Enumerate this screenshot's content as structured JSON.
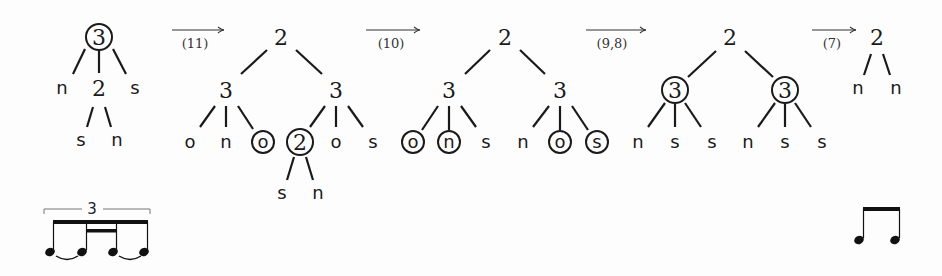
{
  "diagram": {
    "type": "rhythm-tree-rewriting",
    "trees": [
      {
        "id": "tree-1",
        "nodes": [
          {
            "label": "3",
            "x": 99,
            "y": 37,
            "kind": "num",
            "circled": true
          },
          {
            "label": "n",
            "x": 62,
            "y": 88,
            "kind": "leaf",
            "circled": false
          },
          {
            "label": "2",
            "x": 99,
            "y": 88,
            "kind": "num",
            "circled": false
          },
          {
            "label": "s",
            "x": 135,
            "y": 88,
            "kind": "leaf",
            "circled": false
          },
          {
            "label": "s",
            "x": 81,
            "y": 140,
            "kind": "leaf",
            "circled": false
          },
          {
            "label": "n",
            "x": 117,
            "y": 140,
            "kind": "leaf",
            "circled": false
          }
        ],
        "edges": [
          [
            85,
            49,
            73,
            74
          ],
          [
            99,
            50,
            99,
            73
          ],
          [
            113,
            49,
            126,
            74
          ],
          [
            93,
            107,
            87,
            127
          ],
          [
            105,
            107,
            111,
            127
          ]
        ]
      },
      {
        "id": "tree-2",
        "nodes": [
          {
            "label": "2",
            "x": 281,
            "y": 37,
            "kind": "num",
            "circled": false
          },
          {
            "label": "3",
            "x": 226,
            "y": 90,
            "kind": "num",
            "circled": false
          },
          {
            "label": "3",
            "x": 336,
            "y": 90,
            "kind": "num",
            "circled": false
          },
          {
            "label": "o",
            "x": 190,
            "y": 142,
            "kind": "leaf",
            "circled": false
          },
          {
            "label": "n",
            "x": 226,
            "y": 142,
            "kind": "leaf",
            "circled": false
          },
          {
            "label": "o",
            "x": 263,
            "y": 142,
            "kind": "leaf",
            "circled": true
          },
          {
            "label": "2",
            "x": 300,
            "y": 142,
            "kind": "num",
            "circled": true
          },
          {
            "label": "o",
            "x": 336,
            "y": 142,
            "kind": "leaf",
            "circled": false
          },
          {
            "label": "s",
            "x": 373,
            "y": 142,
            "kind": "leaf",
            "circled": false
          },
          {
            "label": "s",
            "x": 282,
            "y": 193,
            "kind": "leaf",
            "circled": false
          },
          {
            "label": "n",
            "x": 318,
            "y": 193,
            "kind": "leaf",
            "circled": false
          }
        ],
        "edges": [
          [
            267,
            50,
            241,
            74
          ],
          [
            296,
            50,
            322,
            74
          ],
          [
            215,
            106,
            200,
            127
          ],
          [
            226,
            106,
            226,
            127
          ],
          [
            238,
            106,
            253,
            129
          ],
          [
            325,
            106,
            310,
            127
          ],
          [
            336,
            106,
            336,
            127
          ],
          [
            348,
            106,
            363,
            127
          ],
          [
            294,
            157,
            287,
            180
          ],
          [
            306,
            157,
            313,
            180
          ]
        ]
      },
      {
        "id": "tree-3",
        "nodes": [
          {
            "label": "2",
            "x": 505,
            "y": 37,
            "kind": "num",
            "circled": false
          },
          {
            "label": "3",
            "x": 449,
            "y": 90,
            "kind": "num",
            "circled": false
          },
          {
            "label": "3",
            "x": 560,
            "y": 90,
            "kind": "num",
            "circled": false
          },
          {
            "label": "o",
            "x": 413,
            "y": 142,
            "kind": "leaf",
            "circled": true
          },
          {
            "label": "n",
            "x": 449,
            "y": 142,
            "kind": "leaf",
            "circled": true
          },
          {
            "label": "s",
            "x": 486,
            "y": 142,
            "kind": "leaf",
            "circled": false
          },
          {
            "label": "n",
            "x": 523,
            "y": 142,
            "kind": "leaf",
            "circled": false
          },
          {
            "label": "o",
            "x": 560,
            "y": 142,
            "kind": "leaf",
            "circled": true
          },
          {
            "label": "s",
            "x": 597,
            "y": 142,
            "kind": "leaf",
            "circled": true
          }
        ],
        "edges": [
          [
            490,
            50,
            465,
            74
          ],
          [
            520,
            50,
            545,
            74
          ],
          [
            438,
            106,
            422,
            130
          ],
          [
            449,
            106,
            449,
            130
          ],
          [
            461,
            106,
            476,
            127
          ],
          [
            549,
            106,
            533,
            127
          ],
          [
            560,
            106,
            560,
            130
          ],
          [
            572,
            106,
            588,
            130
          ]
        ]
      },
      {
        "id": "tree-4",
        "nodes": [
          {
            "label": "2",
            "x": 730,
            "y": 37,
            "kind": "num",
            "circled": false
          },
          {
            "label": "3",
            "x": 675,
            "y": 90,
            "kind": "num",
            "circled": true
          },
          {
            "label": "3",
            "x": 785,
            "y": 90,
            "kind": "num",
            "circled": true
          },
          {
            "label": "n",
            "x": 638,
            "y": 142,
            "kind": "leaf",
            "circled": false
          },
          {
            "label": "s",
            "x": 675,
            "y": 142,
            "kind": "leaf",
            "circled": false
          },
          {
            "label": "s",
            "x": 712,
            "y": 142,
            "kind": "leaf",
            "circled": false
          },
          {
            "label": "n",
            "x": 748,
            "y": 142,
            "kind": "leaf",
            "circled": false
          },
          {
            "label": "s",
            "x": 785,
            "y": 142,
            "kind": "leaf",
            "circled": false
          },
          {
            "label": "s",
            "x": 822,
            "y": 142,
            "kind": "leaf",
            "circled": false
          }
        ],
        "edges": [
          [
            716,
            51,
            688,
            77
          ],
          [
            745,
            51,
            773,
            77
          ],
          [
            665,
            103,
            648,
            127
          ],
          [
            675,
            104,
            675,
            127
          ],
          [
            685,
            103,
            701,
            127
          ],
          [
            775,
            103,
            758,
            127
          ],
          [
            785,
            104,
            785,
            127
          ],
          [
            795,
            103,
            811,
            127
          ]
        ]
      },
      {
        "id": "tree-5",
        "nodes": [
          {
            "label": "2",
            "x": 877,
            "y": 37,
            "kind": "num",
            "circled": false
          },
          {
            "label": "n",
            "x": 858,
            "y": 88,
            "kind": "leaf",
            "circled": false
          },
          {
            "label": "n",
            "x": 896,
            "y": 88,
            "kind": "leaf",
            "circled": false
          }
        ],
        "edges": [
          [
            871,
            54,
            864,
            75
          ],
          [
            883,
            54,
            890,
            75
          ]
        ]
      }
    ],
    "arrows": [
      {
        "label": "(11)",
        "x1": 172,
        "x2": 224,
        "y": 30,
        "label_x": 195,
        "label_y": 48
      },
      {
        "label": "(10)",
        "x1": 366,
        "x2": 420,
        "y": 30,
        "label_x": 391,
        "label_y": 48
      },
      {
        "label": "(9,8)",
        "x1": 586,
        "x2": 646,
        "y": 30,
        "label_x": 612,
        "label_y": 48
      },
      {
        "label": "(7)",
        "x1": 812,
        "x2": 856,
        "y": 30,
        "label_x": 832,
        "label_y": 48
      }
    ],
    "notation": {
      "left": {
        "tuplet_label": "3",
        "description": "eighth-note triplet grouping with inner sixteenth beam, two ties"
      },
      "right": {
        "description": "two beamed eighth notes"
      }
    }
  }
}
